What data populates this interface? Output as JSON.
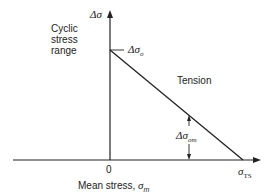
{
  "diagram": {
    "y_axis_symbol": "Δσ",
    "y_axis_label_lines": [
      "Cyclic",
      "stress",
      "range"
    ],
    "x_axis_label": "Mean stress, ",
    "x_axis_label_symbol": "σ",
    "x_axis_label_sub": "m",
    "origin_label": "0",
    "intercept_y_symbol": "Δσ",
    "intercept_y_sub": "o",
    "intercept_x_symbol": "σ",
    "intercept_x_sub": "TS",
    "region_label": "Tension",
    "dimension_symbol": "Δσ",
    "dimension_sub": "om",
    "line_color": "#222222"
  }
}
